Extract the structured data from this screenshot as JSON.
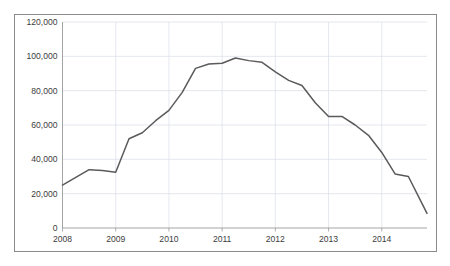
{
  "chart_data": {
    "type": "line",
    "title": "",
    "subtitle": "",
    "xlabel": "",
    "ylabel": "",
    "xlim": [
      2008.0,
      2014.85
    ],
    "ylim": [
      0,
      120000
    ],
    "grid": true,
    "legend": null,
    "legend_position": "none",
    "line_color": "#5a5a5a",
    "grid_color": "#d9dde6",
    "axis_color": "#9a9a9a",
    "frame_color": "#8a8a8a",
    "background": "#ffffff",
    "y_ticks": [
      0,
      20000,
      40000,
      60000,
      80000,
      100000,
      120000
    ],
    "y_tick_labels": [
      "0",
      "20,000",
      "40,000",
      "60,000",
      "80,000",
      "100,000",
      "120,000"
    ],
    "x_ticks": [
      2008,
      2009,
      2010,
      2011,
      2012,
      2013,
      2014
    ],
    "x_tick_labels": [
      "2008",
      "2009",
      "2010",
      "2011",
      "2012",
      "2013",
      "2014"
    ],
    "series": [
      {
        "name": "series-1",
        "x": [
          2008.0,
          2008.25,
          2008.5,
          2008.75,
          2009.0,
          2009.25,
          2009.5,
          2009.75,
          2010.0,
          2010.25,
          2010.5,
          2010.75,
          2011.0,
          2011.25,
          2011.5,
          2011.75,
          2012.0,
          2012.25,
          2012.5,
          2012.75,
          2013.0,
          2013.25,
          2013.5,
          2013.75,
          2014.0,
          2014.25,
          2014.5,
          2014.85
        ],
        "values": [
          25000,
          29500,
          34000,
          33500,
          32500,
          52000,
          55500,
          62500,
          68500,
          79000,
          93000,
          95500,
          96000,
          99000,
          97500,
          96500,
          91000,
          86000,
          83000,
          73000,
          65000,
          65000,
          60000,
          54000,
          44000,
          31500,
          30000,
          8500
        ]
      }
    ]
  },
  "watermark": {
    "text": "",
    "visible": false
  }
}
